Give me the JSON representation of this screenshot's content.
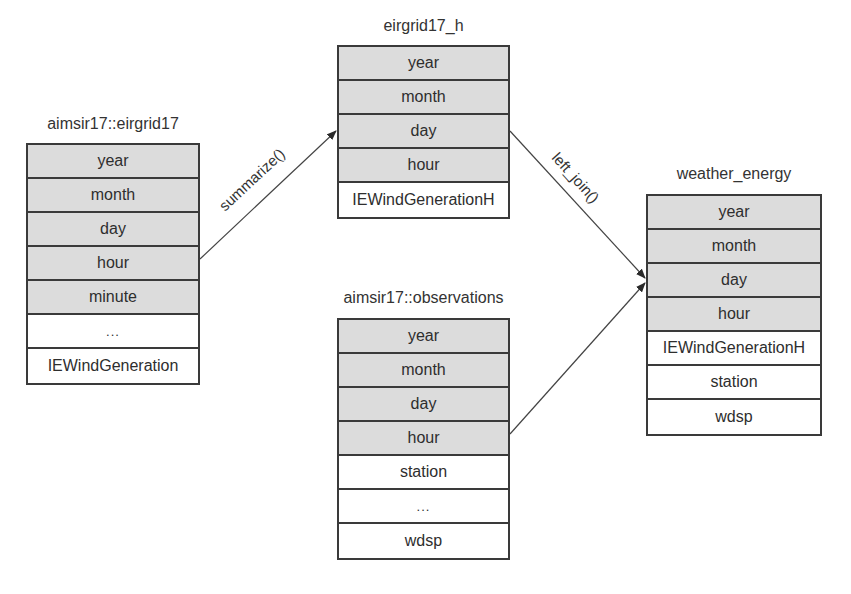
{
  "diagram": {
    "tables": [
      {
        "id": "eirgrid17",
        "title": "aimsir17::eirgrid17",
        "rows": [
          {
            "label": "year",
            "key": true
          },
          {
            "label": "month",
            "key": true
          },
          {
            "label": "day",
            "key": true
          },
          {
            "label": "hour",
            "key": true
          },
          {
            "label": "minute",
            "key": true
          },
          {
            "label": "...",
            "key": false
          },
          {
            "label": "IEWindGeneration",
            "key": false
          }
        ]
      },
      {
        "id": "eirgrid17_h",
        "title": "eirgrid17_h",
        "rows": [
          {
            "label": "year",
            "key": true
          },
          {
            "label": "month",
            "key": true
          },
          {
            "label": "day",
            "key": true
          },
          {
            "label": "hour",
            "key": true
          },
          {
            "label": "IEWindGenerationH",
            "key": false
          }
        ]
      },
      {
        "id": "observations",
        "title": "aimsir17::observations",
        "rows": [
          {
            "label": "year",
            "key": true
          },
          {
            "label": "month",
            "key": true
          },
          {
            "label": "day",
            "key": true
          },
          {
            "label": "hour",
            "key": true
          },
          {
            "label": "station",
            "key": false
          },
          {
            "label": "...",
            "key": false
          },
          {
            "label": "wdsp",
            "key": false
          }
        ]
      },
      {
        "id": "weather_energy",
        "title": "weather_energy",
        "rows": [
          {
            "label": "year",
            "key": true
          },
          {
            "label": "month",
            "key": true
          },
          {
            "label": "day",
            "key": true
          },
          {
            "label": "hour",
            "key": true
          },
          {
            "label": "IEWindGenerationH",
            "key": false
          },
          {
            "label": "station",
            "key": false
          },
          {
            "label": "wdsp",
            "key": false
          }
        ]
      }
    ],
    "edges": [
      {
        "from": "eirgrid17",
        "to": "eirgrid17_h",
        "label": "summarize()"
      },
      {
        "from": "eirgrid17_h",
        "to": "weather_energy",
        "label": "left_join()"
      },
      {
        "from": "observations",
        "to": "weather_energy",
        "label": ""
      }
    ],
    "colors": {
      "key_fill": "#dcdcdc",
      "border": "#3a3a3a",
      "background": "#ffffff"
    }
  }
}
